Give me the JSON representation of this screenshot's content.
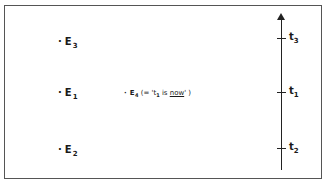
{
  "diagram": {
    "events": [
      {
        "id": "E3",
        "name": "E",
        "sub": "3"
      },
      {
        "id": "E1",
        "name": "E",
        "sub": "1"
      },
      {
        "id": "E2",
        "name": "E",
        "sub": "2"
      },
      {
        "id": "E4",
        "name": "E",
        "sub": "4",
        "note_prefix": "(= '",
        "note_t": "t",
        "note_t_sub": "1",
        "note_is": " is ",
        "note_now": "now",
        "note_suffix": "' )"
      }
    ],
    "timeline": {
      "ticks": [
        {
          "name": "t",
          "sub": "3"
        },
        {
          "name": "t",
          "sub": "1"
        },
        {
          "name": "t",
          "sub": "2"
        }
      ]
    },
    "dot": "·"
  }
}
